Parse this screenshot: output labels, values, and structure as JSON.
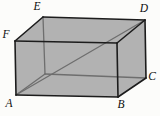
{
  "diagram": {
    "width": 160,
    "height": 116,
    "background_color": "#fcfcfa",
    "face_fill_color": "#b2b2b2",
    "outer_edge_color": "#1c1c1c",
    "inner_line_color": "#6e6e6e",
    "label_color": "#0d0d0d",
    "label_font_size": 11.5,
    "outer_edge_width": 1.6,
    "inner_line_width": 1.3,
    "vertices": {
      "A": {
        "x": 16,
        "y": 95,
        "label": "A",
        "hidden": false
      },
      "B": {
        "x": 118,
        "y": 97,
        "label": "B",
        "hidden": false
      },
      "C": {
        "x": 146,
        "y": 78,
        "label": "C",
        "hidden": false
      },
      "D": {
        "x": 145,
        "y": 20,
        "label": "D",
        "hidden": false
      },
      "E": {
        "x": 43,
        "y": 17,
        "label": "E",
        "hidden": false
      },
      "F": {
        "x": 15,
        "y": 41,
        "label": "F",
        "hidden": false
      },
      "G": {
        "x": 117,
        "y": 43,
        "label": "",
        "hidden": false
      },
      "H": {
        "x": 45,
        "y": 74,
        "label": "",
        "hidden": true
      }
    },
    "faces": [
      {
        "name": "top-face",
        "points": [
          "F",
          "E",
          "D",
          "G"
        ]
      },
      {
        "name": "front-face",
        "points": [
          "F",
          "G",
          "B",
          "A"
        ]
      },
      {
        "name": "right-face",
        "points": [
          "G",
          "D",
          "C",
          "B"
        ]
      }
    ],
    "hidden_edges": [
      {
        "name": "edge-E-H",
        "from": "E",
        "to": "H"
      },
      {
        "name": "edge-A-H",
        "from": "A",
        "to": "H"
      },
      {
        "name": "edge-H-C",
        "from": "H",
        "to": "C"
      }
    ],
    "diagonals": [
      {
        "name": "space-diagonal-A-D",
        "from": "A",
        "to": "D"
      }
    ],
    "outer_edges": [
      {
        "name": "edge-A-F",
        "from": "A",
        "to": "F"
      },
      {
        "name": "edge-F-E",
        "from": "F",
        "to": "E"
      },
      {
        "name": "edge-E-D",
        "from": "E",
        "to": "D"
      },
      {
        "name": "edge-D-C",
        "from": "D",
        "to": "C"
      },
      {
        "name": "edge-C-B",
        "from": "C",
        "to": "B"
      },
      {
        "name": "edge-B-A",
        "from": "B",
        "to": "A"
      },
      {
        "name": "edge-F-G",
        "from": "F",
        "to": "G"
      },
      {
        "name": "edge-G-D",
        "from": "G",
        "to": "D"
      },
      {
        "name": "edge-G-B",
        "from": "G",
        "to": "B"
      }
    ],
    "labels": [
      {
        "name": "vertex-label-A",
        "text": "A",
        "x": 9,
        "y": 103
      },
      {
        "name": "vertex-label-B",
        "text": "B",
        "x": 121,
        "y": 104
      },
      {
        "name": "vertex-label-C",
        "text": "C",
        "x": 152,
        "y": 76
      },
      {
        "name": "vertex-label-D",
        "text": "D",
        "x": 144,
        "y": 8
      },
      {
        "name": "vertex-label-E",
        "text": "E",
        "x": 37,
        "y": 6
      },
      {
        "name": "vertex-label-F",
        "text": "F",
        "x": 6,
        "y": 34
      }
    ]
  }
}
